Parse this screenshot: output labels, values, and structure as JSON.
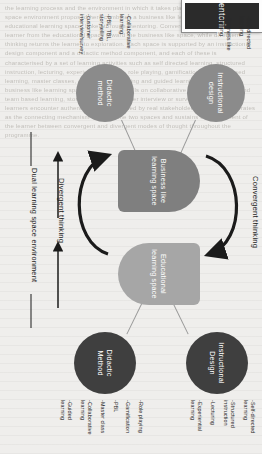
{
  "figure": {
    "center": {
      "label": "Mentoring"
    },
    "spaces": [
      {
        "id": "business",
        "label": "Business like learning space",
        "color": "#7f7f7f"
      },
      {
        "id": "educational",
        "label": "Educational learning space",
        "color": "#a6a6a6"
      }
    ],
    "nodes": [
      {
        "id": "instructional-design-top",
        "label": "Instructional design",
        "color": "#8b8b8b",
        "attributes": [
          "-Self directed learning",
          "-Business like learning"
        ]
      },
      {
        "id": "didactic-method-top",
        "label": "Didactic method",
        "color": "#8b8b8b",
        "attributes": [
          "-Collaborative learning",
          "-PBL, TBL, storytelling",
          "-customer interview/survey"
        ]
      },
      {
        "id": "instructional-design-bottom",
        "label": "Instructional Design",
        "color": "#3f3f3f",
        "attributes": [
          "-Self-directed learning",
          "-Structured instruction",
          "-Lecturing",
          "-Experiential learning"
        ]
      },
      {
        "id": "didactic-method-bottom",
        "label": "Didactic Method",
        "color": "#3f3f3f",
        "attributes": [
          "-Role playing",
          "-Gamification",
          "-PBL",
          "-Master class",
          "-Collaborative learning",
          "-Guided learning"
        ]
      }
    ],
    "arcs": [
      {
        "id": "convergent",
        "label": "Convergent thinking"
      },
      {
        "id": "divergent",
        "label": "Divergent thinking"
      }
    ],
    "environment": {
      "label": "Dual learning space environment"
    }
  },
  "background": {
    "ghost_text": "the learning process and the environment in which it takes place. The dual learning space environment proposed here combines a business like learning space with an educational learning space, linked through mentoring. Convergent thinking draws the learner from the educational space toward the business like space, while divergent thinking returns the learner to exploration. Each space is supported by an instructional design component and a didactic method component, and each of these is characterised by a set of learning activities such as self directed learning, structured instruction, lecturing, experiential learning, role playing, gamification, problem based learning, master classes, collaborative learning and guided learning. Within the business like learning space the emphasis falls on collaborative learning, problem and team based learning, storytelling and customer interview or survey work, so that learners encounter authentic problems framed by real stakeholders. Mentoring operates as the connecting mechanism between the two spaces and sustains the movement of the learner between convergent and divergent modes of thought throughout the programme."
  }
}
